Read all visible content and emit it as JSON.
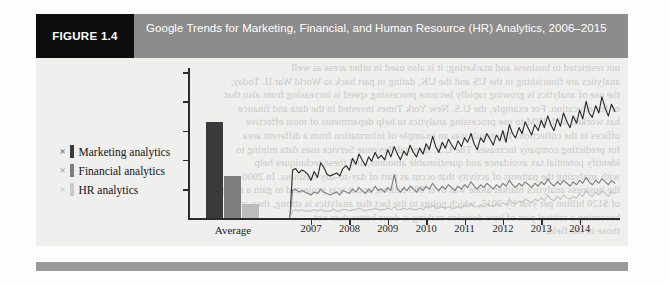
{
  "figure": {
    "tag": "FIGURE 1.4",
    "title": "Google Trends for Marketing, Financial, and Human Resource (HR) Analytics, 2006–2015"
  },
  "colors": {
    "header_band": "#8c8c8c",
    "tag_block": "#0d0d0d",
    "footer_band": "#9a9a9a",
    "marketing": "#3a3a3a",
    "financial": "#7d7d7d",
    "hr": "#bcbcbc",
    "axis": "#2b2b2b",
    "plot_background": "#efefee"
  },
  "legend": {
    "position": "left",
    "marker_glyph": "×",
    "items": [
      {
        "marker": "×",
        "label": "Marketing analytics",
        "color": "#3a3a3a"
      },
      {
        "marker": "×",
        "label": "Financial analytics",
        "color": "#7d7d7d"
      },
      {
        "marker": "×",
        "label": "HR analytics",
        "color": "#bcbcbc"
      }
    ]
  },
  "bleed_text": [
    "not restricted to business and marketing; it is also used in other areas as well",
    "analytics are flourishing in the US and the UK, dating in part back to World War II. Today,",
    "the use of analytics is growing rapidly because processing speed is increasing from also that",
    "or for education. For example, the U.S. New York Times invested in the data and finance",
    "has worked with IBM to use processing analytics to help departments of most effective",
    "offices in the collection. The result was an example of information from a different area",
    "for predicting company increases. The U.S. Internal Revenue Service uses data mining to",
    "identify potential tax avoidance and questionable amounts, and these techniques help",
    "with analyzing the patterns of activity that occur as part of day-to-day business. In 2006",
    "the business analytics market alone was over $89 billion, and it was projected to gain a merger",
    "of $120 billion per year by 2015, which points to the fact that analytics is strong, they are",
    "becoming a critical part of how decision making is done better than not",
    "those in the field."
  ],
  "chart_data": [
    {
      "type": "bar",
      "title": "Average",
      "categories": [
        "Average"
      ],
      "xlabel": "Average",
      "ylabel": "",
      "grid": false,
      "legend_position": "left",
      "ylim": [
        0,
        100
      ],
      "series": [
        {
          "name": "Marketing analytics",
          "values": [
            66
          ],
          "color": "#3a3a3a"
        },
        {
          "name": "Financial analytics",
          "values": [
            29
          ],
          "color": "#7d7d7d"
        },
        {
          "name": "HR analytics",
          "values": [
            10
          ],
          "color": "#bcbcbc"
        }
      ]
    },
    {
      "type": "line",
      "title": "Google Trends search interest 2006–2015",
      "xlabel": "",
      "ylabel": "",
      "grid": false,
      "legend_position": "left",
      "ylim": [
        0,
        100
      ],
      "xlim": [
        2006.4,
        2015.0
      ],
      "tick_labels": [
        "2007",
        "2008",
        "2009",
        "2010",
        "2011",
        "2012",
        "2013",
        "2014"
      ],
      "tick_values": [
        2007,
        2008,
        2009,
        2010,
        2011,
        2012,
        2013,
        2014
      ],
      "x": [
        2006.45,
        2006.52,
        2006.6,
        2006.68,
        2006.76,
        2006.84,
        2006.92,
        2007.0,
        2007.08,
        2007.17,
        2007.25,
        2007.33,
        2007.42,
        2007.5,
        2007.58,
        2007.67,
        2007.75,
        2007.83,
        2007.92,
        2008.0,
        2008.08,
        2008.17,
        2008.25,
        2008.33,
        2008.42,
        2008.5,
        2008.58,
        2008.67,
        2008.75,
        2008.83,
        2008.92,
        2009.0,
        2009.08,
        2009.17,
        2009.25,
        2009.33,
        2009.42,
        2009.5,
        2009.58,
        2009.67,
        2009.75,
        2009.83,
        2009.92,
        2010.0,
        2010.08,
        2010.17,
        2010.25,
        2010.33,
        2010.42,
        2010.5,
        2010.58,
        2010.67,
        2010.75,
        2010.83,
        2010.92,
        2011.0,
        2011.08,
        2011.17,
        2011.25,
        2011.33,
        2011.42,
        2011.5,
        2011.58,
        2011.67,
        2011.75,
        2011.83,
        2011.92,
        2012.0,
        2012.08,
        2012.17,
        2012.25,
        2012.33,
        2012.42,
        2012.5,
        2012.58,
        2012.67,
        2012.75,
        2012.83,
        2012.92,
        2013.0,
        2013.08,
        2013.17,
        2013.25,
        2013.33,
        2013.42,
        2013.5,
        2013.58,
        2013.67,
        2013.75,
        2013.83,
        2013.92,
        2014.0,
        2014.08,
        2014.17,
        2014.25,
        2014.33,
        2014.42,
        2014.5,
        2014.58,
        2014.67,
        2014.75,
        2014.83,
        2014.92
      ],
      "series": [
        {
          "name": "Marketing analytics",
          "color": "#262626",
          "values": [
            0,
            33,
            34,
            31,
            33,
            32,
            30,
            26,
            32,
            28,
            38,
            35,
            30,
            29,
            30,
            31,
            29,
            34,
            36,
            33,
            41,
            37,
            44,
            40,
            36,
            42,
            39,
            45,
            41,
            43,
            40,
            47,
            42,
            49,
            44,
            40,
            46,
            43,
            50,
            45,
            42,
            48,
            44,
            51,
            47,
            56,
            49,
            45,
            52,
            48,
            54,
            50,
            47,
            53,
            49,
            55,
            52,
            58,
            51,
            47,
            55,
            52,
            58,
            54,
            50,
            57,
            53,
            60,
            52,
            64,
            58,
            55,
            62,
            58,
            66,
            61,
            57,
            64,
            60,
            67,
            62,
            70,
            64,
            60,
            68,
            63,
            72,
            66,
            62,
            70,
            65,
            74,
            68,
            80,
            72,
            69,
            77,
            72,
            83,
            75,
            70,
            78,
            73
          ]
        },
        {
          "name": "Financial analytics",
          "color": "#7d7d7d",
          "values": [
            0,
            19,
            20,
            18,
            19,
            18,
            17,
            16,
            18,
            17,
            20,
            18,
            17,
            16,
            17,
            18,
            16,
            19,
            18,
            17,
            20,
            18,
            21,
            19,
            17,
            20,
            18,
            22,
            19,
            20,
            18,
            21,
            19,
            30,
            20,
            18,
            21,
            19,
            22,
            20,
            18,
            21,
            19,
            22,
            20,
            24,
            21,
            19,
            22,
            20,
            23,
            21,
            19,
            22,
            20,
            23,
            21,
            25,
            22,
            20,
            23,
            21,
            24,
            22,
            20,
            23,
            21,
            24,
            22,
            26,
            23,
            21,
            24,
            22,
            25,
            23,
            21,
            24,
            22,
            25,
            23,
            27,
            24,
            22,
            25,
            23,
            26,
            24,
            22,
            25,
            23,
            26,
            24,
            28,
            25,
            23,
            26,
            24,
            27,
            25,
            23,
            26,
            24
          ]
        },
        {
          "name": "HR analytics",
          "color": "#c2c2c2",
          "values": [
            0,
            5,
            6,
            5,
            6,
            5,
            5,
            5,
            6,
            5,
            6,
            5,
            5,
            5,
            6,
            5,
            5,
            6,
            6,
            5,
            6,
            6,
            7,
            6,
            5,
            6,
            6,
            7,
            6,
            6,
            6,
            7,
            6,
            8,
            6,
            6,
            7,
            6,
            7,
            6,
            6,
            7,
            6,
            8,
            7,
            9,
            7,
            7,
            8,
            7,
            8,
            7,
            7,
            8,
            7,
            9,
            8,
            10,
            8,
            8,
            9,
            8,
            10,
            9,
            8,
            10,
            9,
            11,
            9,
            13,
            11,
            10,
            12,
            11,
            13,
            12,
            11,
            13,
            12,
            14,
            12,
            16,
            13,
            12,
            15,
            13,
            16,
            14,
            13,
            15,
            14,
            17,
            15,
            19,
            16,
            15,
            18,
            16,
            19,
            17,
            15,
            18,
            17
          ]
        }
      ]
    }
  ]
}
